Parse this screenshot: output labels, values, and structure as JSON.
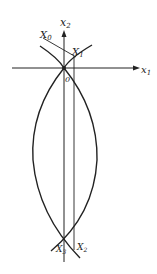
{
  "diagram": {
    "labels": {
      "x1_axis": "x",
      "x1_sub": "1",
      "x2_axis": "x",
      "x2_sub": "2",
      "origin": "0",
      "X0": "X",
      "X0_sub": "0",
      "X1": "X",
      "X1_sub": "1",
      "X2": "X",
      "X2_sub": "2",
      "X3": "X",
      "X3_sub": "3"
    },
    "colors": {
      "stroke": "#222222",
      "background": "#ffffff"
    }
  }
}
